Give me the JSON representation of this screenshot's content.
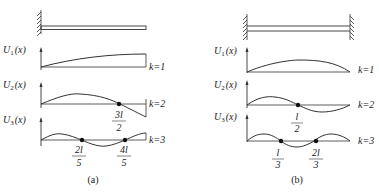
{
  "panels": [
    {
      "id": "a",
      "caption": "(a)",
      "support": "cantilever",
      "modes": [
        {
          "axis_label": "U",
          "sub": "1",
          "arg": "(x)",
          "k_label": "k=1",
          "nodes": []
        },
        {
          "axis_label": "U",
          "sub": "2",
          "arg": "(x)",
          "k_label": "k=2",
          "nodes": [
            {
              "num": "3l",
              "den": "2",
              "frac": 0.75
            }
          ]
        },
        {
          "axis_label": "U",
          "sub": "3",
          "arg": "(x)",
          "k_label": "k=3",
          "nodes": [
            {
              "num": "2l",
              "den": "5",
              "frac": 0.4
            },
            {
              "num": "4l",
              "den": "5",
              "frac": 0.8
            }
          ]
        }
      ]
    },
    {
      "id": "b",
      "caption": "(b)",
      "support": "fixed-fixed",
      "modes": [
        {
          "axis_label": "U",
          "sub": "1",
          "arg": "(x)",
          "k_label": "k=1",
          "nodes": []
        },
        {
          "axis_label": "U",
          "sub": "2",
          "arg": "(x)",
          "k_label": "k=2",
          "nodes": [
            {
              "num": "l",
              "den": "2",
              "frac": 0.5
            }
          ]
        },
        {
          "axis_label": "U",
          "sub": "3",
          "arg": "(x)",
          "k_label": "k=3",
          "nodes": [
            {
              "num": "l",
              "den": "3",
              "frac": 0.3333
            },
            {
              "num": "2l",
              "den": "3",
              "frac": 0.6667
            }
          ]
        }
      ]
    }
  ],
  "colors": {
    "line": "#333333",
    "node": "#111111"
  }
}
